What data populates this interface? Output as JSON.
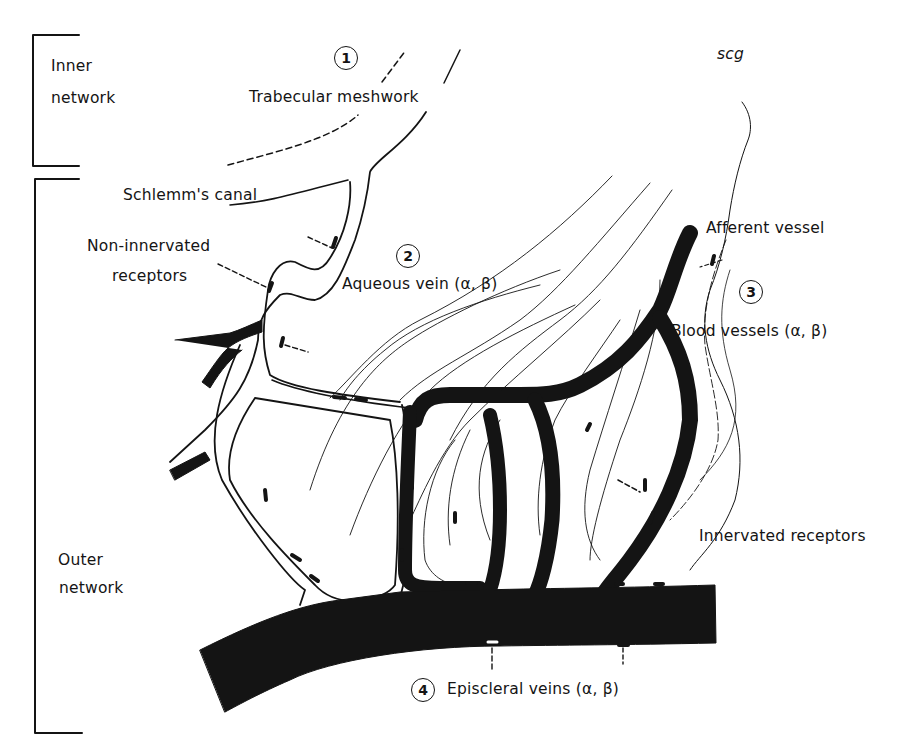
{
  "figure": {
    "brackets": {
      "inner": {
        "label_line1": "Inner",
        "label_line2": "network"
      },
      "outer": {
        "label_line1": "Outer",
        "label_line2": "network"
      }
    },
    "regions": [
      {
        "number": "1",
        "label": "Trabecular meshwork"
      },
      {
        "number": "2",
        "label": "Aqueous vein (α, β)"
      },
      {
        "number": "3",
        "label": "Blood vessels (α, β)"
      },
      {
        "number": "4",
        "label": "Episcleral veins (α, β)"
      }
    ],
    "labels": {
      "schlemm": "Schlemm's canal",
      "non_innervated_1": "Non-innervated",
      "non_innervated_2": "receptors",
      "scg": "scg",
      "afferent": "Afferent vessel",
      "innervated": "Innervated receptors"
    },
    "colors": {
      "ink": "#141414",
      "paper": "#ffffff",
      "speckle": "#6a6a6a"
    }
  }
}
